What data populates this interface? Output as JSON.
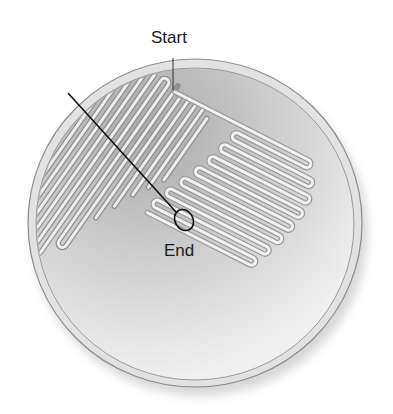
{
  "diagram": {
    "type": "petri-dish-streak-plate",
    "labels": {
      "start": "Start",
      "end": "End"
    },
    "colors": {
      "dish_rim": "#d6d6d6",
      "dish_outline": "#8a8a8a",
      "agar_dark": "#b9b9b9",
      "agar_light": "#f2f2f2",
      "streak": "#e9e9e9",
      "streak_shadow": "#9a9a9a",
      "loop_line": "#111111"
    },
    "elements": [
      "petri-dish",
      "streak-region-1",
      "streak-region-2",
      "inoculating-loop",
      "start-label",
      "end-label"
    ]
  }
}
